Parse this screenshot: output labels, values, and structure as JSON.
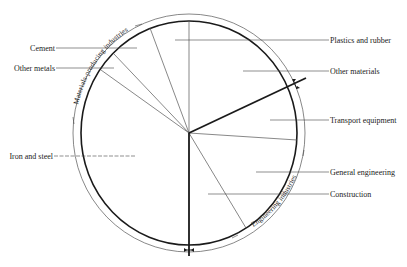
{
  "diagram": {
    "type": "sector-wheel",
    "groups": [
      {
        "label": "Materials-producing industries",
        "position": "upper-left outer ring"
      },
      {
        "label": "Engineering industries",
        "position": "lower-right outer ring"
      }
    ],
    "left_labels": [
      {
        "id": "cement",
        "text": "Cement"
      },
      {
        "id": "other-metals",
        "text": "Other metals"
      },
      {
        "id": "iron-steel",
        "text": "Iron and steel"
      }
    ],
    "right_labels": [
      {
        "id": "plastics-rubber",
        "text": "Plastics and rubber"
      },
      {
        "id": "other-materials",
        "text": "Other materials"
      },
      {
        "id": "transport-equipment",
        "text": "Transport equipment"
      },
      {
        "id": "general-engineering",
        "text": "General engineering"
      },
      {
        "id": "construction",
        "text": "Construction"
      }
    ],
    "colors": {
      "line": "#1a1a1a",
      "thin_line": "#555555",
      "text": "#222222",
      "background": "#ffffff"
    }
  }
}
